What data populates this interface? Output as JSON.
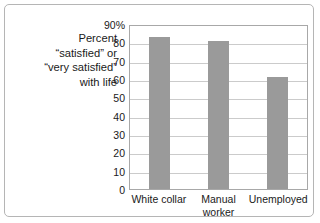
{
  "chart_data": {
    "type": "bar",
    "title": "",
    "xlabel": "",
    "ylabel": "Percent “satisfied” or “very satisfied” with life",
    "ylabel_lines": [
      "Percent",
      "“satisfied” or",
      "“very satisfied”",
      "with life"
    ],
    "categories": [
      "White collar",
      "Manual worker",
      "Unemployed"
    ],
    "category_label_lines": [
      [
        "White collar"
      ],
      [
        "Manual",
        "worker"
      ],
      [
        "Unemployed"
      ]
    ],
    "values": [
      83,
      81,
      61
    ],
    "ylim": [
      0,
      90
    ],
    "ytick_values": [
      90,
      80,
      70,
      60,
      50,
      40,
      30,
      20,
      10,
      0
    ],
    "ytick_labels": [
      "90%",
      "80",
      "70",
      "60",
      "50",
      "40",
      "30",
      "20",
      "10",
      "0"
    ],
    "grid": true,
    "legend": false,
    "bar_color": "#9a9a9a",
    "grid_color": "#cbcbcb",
    "plot_border_color": "#a8a8a8",
    "frame_border_color": "#b5b5b5",
    "background_color": "#ffffff",
    "text_color": "#1a1a1a"
  }
}
